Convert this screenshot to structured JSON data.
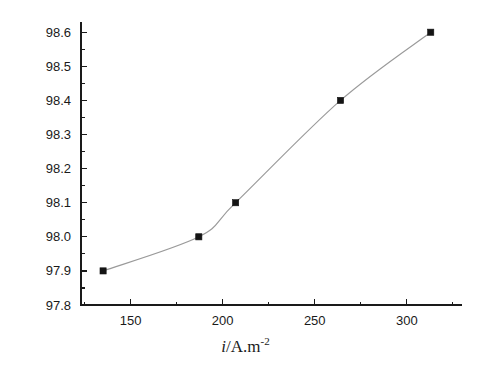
{
  "chart_data": {
    "type": "line",
    "title": "",
    "xlabel": "i/A.m-2",
    "ylabel": "η / %",
    "x": [
      135,
      187,
      207,
      264,
      313
    ],
    "values": [
      97.9,
      98.0,
      98.1,
      98.4,
      98.6
    ],
    "series": [
      {
        "name": "current efficiency",
        "x": [
          135,
          187,
          207,
          264,
          313
        ],
        "values": [
          97.9,
          98.0,
          98.1,
          98.4,
          98.6
        ]
      }
    ],
    "xlim": [
      123,
      330
    ],
    "ylim": [
      97.8,
      98.63
    ],
    "xticks": [
      150,
      200,
      250,
      300
    ],
    "xtick_labels": [
      "150",
      "200",
      "250",
      "300"
    ],
    "x_minor_ticks": [
      125,
      175,
      225,
      275,
      325
    ],
    "yticks": [
      97.8,
      97.9,
      98.0,
      98.1,
      98.2,
      98.3,
      98.4,
      98.5,
      98.6
    ],
    "ytick_labels": [
      "97.8",
      "97.9",
      "98.0",
      "98.1",
      "98.2",
      "98.3",
      "98.4",
      "98.5",
      "98.6"
    ],
    "y_minor_ticks": [
      97.85,
      97.95,
      98.05,
      98.15,
      98.25,
      98.35,
      98.45,
      98.55
    ],
    "grid": false,
    "legend": null,
    "marker": "square",
    "marker_color": "#141414",
    "line_color": "#9a9a9a",
    "axis_color": "#1a1a1a",
    "background": "#ffffff"
  },
  "labels": {
    "x_axis_symbol": "i",
    "x_axis_unit": "/A.m",
    "x_axis_exponent": "-2",
    "y_axis_full": "η / %"
  }
}
